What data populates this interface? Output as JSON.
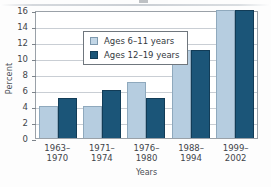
{
  "chart_data": {
    "type": "bar",
    "title": "",
    "xlabel": "Years",
    "ylabel": "Percent",
    "categories": [
      "1963–1970",
      "1971–1974",
      "1976–1980",
      "1988–1994",
      "1999–2002"
    ],
    "series": [
      {
        "name": "Ages 6–11 years",
        "values": [
          4,
          4,
          7,
          11,
          16
        ],
        "color": "#b6cde0"
      },
      {
        "name": "Ages 12–19 years",
        "values": [
          5,
          6,
          5,
          11,
          16
        ],
        "color": "#1b5578"
      }
    ],
    "ylim": [
      0,
      16
    ],
    "yticks": [
      16,
      14,
      12,
      10,
      8,
      6,
      4,
      2,
      0
    ],
    "ytick_labels": [
      "16",
      "14",
      "12",
      "10",
      "8",
      "6",
      "4",
      "2",
      "0"
    ],
    "grid": true,
    "legend_position": "upper left"
  },
  "axes": {
    "y_title": "Percent",
    "x_title": "Years"
  },
  "legend": {
    "entries": [
      {
        "label": "Ages 6–11 years",
        "swatch": "light-blue"
      },
      {
        "label": "Ages 12–19 years",
        "swatch": "dark-blue"
      }
    ]
  }
}
